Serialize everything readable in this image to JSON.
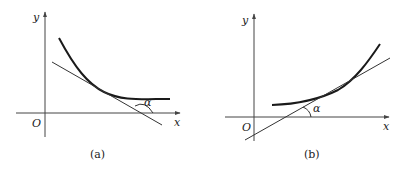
{
  "panels": [
    {
      "id": "a",
      "caption": "(a)",
      "axis_x_label": "x",
      "axis_y_label": "y",
      "origin_label": "O",
      "angle_label": "α",
      "description": "Decreasing convex curve with tangent line; tangent makes obtuse angle α with x-axis"
    },
    {
      "id": "b",
      "caption": "(b)",
      "axis_x_label": "x",
      "axis_y_label": "y",
      "origin_label": "O",
      "angle_label": "α",
      "description": "Increasing convex curve with tangent line; tangent makes acute angle α with x-axis"
    }
  ],
  "colors": {
    "axis": "#444444",
    "curve": "#1a1a1a",
    "tangent": "#333333",
    "background": "#ffffff"
  }
}
